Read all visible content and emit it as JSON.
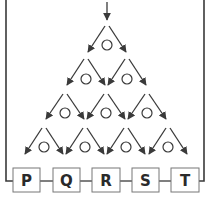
{
  "diagram": {
    "type": "galton-board",
    "colors": {
      "line": "#3a3a3a",
      "box_border": "#777777",
      "label": "#2a2a2a",
      "background": "#ffffff"
    },
    "input_arrow": {
      "x": 107,
      "y1": 2,
      "y2": 20
    },
    "rows": [
      {
        "y_top": 26,
        "y_bottom": 52,
        "circle_y": 45,
        "peg_x": [
          107
        ]
      },
      {
        "y_top": 59,
        "y_bottom": 85,
        "circle_y": 79,
        "peg_x": [
          86,
          127
        ]
      },
      {
        "y_top": 94,
        "y_bottom": 119,
        "circle_y": 113,
        "peg_x": [
          65,
          106,
          147
        ]
      },
      {
        "y_top": 128,
        "y_bottom": 154,
        "circle_y": 147,
        "peg_x": [
          44,
          85,
          126,
          168
        ]
      }
    ],
    "arrow_spread": 17,
    "bins": [
      {
        "label": "P",
        "x": 13,
        "w": 27
      },
      {
        "label": "Q",
        "x": 53,
        "w": 27
      },
      {
        "label": "R",
        "x": 92,
        "w": 28
      },
      {
        "label": "S",
        "x": 132,
        "w": 27
      },
      {
        "label": "T",
        "x": 171,
        "w": 28
      }
    ],
    "bin_y": 168,
    "bin_h": 24,
    "connector_y": 181,
    "frame": {
      "left_x": 6,
      "right_x": 204,
      "top_y": 0
    }
  }
}
